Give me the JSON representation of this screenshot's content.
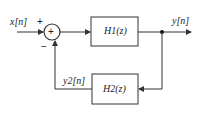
{
  "diagram": {
    "type": "feedback-block-diagram",
    "input_label": "x[n]",
    "output_label": "y[n]",
    "feedback_label": "y2[n]",
    "summer": {
      "symbol": "+",
      "input_sign": "+",
      "feedback_sign": "−"
    },
    "blocks": [
      {
        "id": "H1",
        "label": "H1(z)",
        "position": "forward"
      },
      {
        "id": "H2",
        "label": "H2(z)",
        "position": "feedback"
      }
    ]
  }
}
